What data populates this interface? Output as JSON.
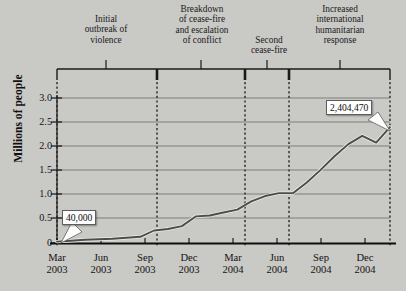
{
  "chart_data": {
    "type": "line",
    "title": "",
    "xlabel": "",
    "ylabel": "Millions of people",
    "ylim": [
      0,
      3.25
    ],
    "yticks": [
      "0",
      "0.5",
      "1.0",
      "1.5",
      "2.0",
      "2.5",
      "3.0"
    ],
    "ytick_values": [
      0,
      0.5,
      1.0,
      1.5,
      2.0,
      2.5,
      3.0
    ],
    "grid": "horizontal solid gridlines plus dotted vertical event lines",
    "legend": "none",
    "categories": [
      "Mar\n2003",
      "Jun\n2003",
      "Sep\n2003",
      "Dec\n2003",
      "Mar\n2004",
      "Jun\n2004",
      "Sep\n2004",
      "Dec\n2004"
    ],
    "x_tick_labels": [
      "Mar 2003",
      "Jun 2003",
      "Sep 2003",
      "Dec 2003",
      "Mar 2004",
      "Jun 2004",
      "Sep 2004",
      "Dec 2004"
    ],
    "series": [
      {
        "name": "Displaced people",
        "units": "millions",
        "points": [
          {
            "t": "2003-03",
            "v": 0.04
          },
          {
            "t": "2003-04",
            "v": 0.06
          },
          {
            "t": "2003-05",
            "v": 0.08
          },
          {
            "t": "2003-06",
            "v": 0.09
          },
          {
            "t": "2003-07",
            "v": 0.1
          },
          {
            "t": "2003-08",
            "v": 0.12
          },
          {
            "t": "2003-09",
            "v": 0.14
          },
          {
            "t": "2003-10",
            "v": 0.27
          },
          {
            "t": "2003-11",
            "v": 0.3
          },
          {
            "t": "2003-12",
            "v": 0.36
          },
          {
            "t": "2004-01",
            "v": 0.56
          },
          {
            "t": "2004-02",
            "v": 0.58
          },
          {
            "t": "2004-03",
            "v": 0.64
          },
          {
            "t": "2004-04",
            "v": 0.7
          },
          {
            "t": "2004-05",
            "v": 0.87
          },
          {
            "t": "2004-06",
            "v": 0.98
          },
          {
            "t": "2004-07",
            "v": 1.04
          },
          {
            "t": "2004-08",
            "v": 1.04
          },
          {
            "t": "2004-09",
            "v": 1.26
          },
          {
            "t": "2004-10",
            "v": 1.52
          },
          {
            "t": "2004-11",
            "v": 1.8
          },
          {
            "t": "2004-12",
            "v": 2.05
          },
          {
            "t": "2005-01",
            "v": 2.22
          },
          {
            "t": "2005-02",
            "v": 2.08
          },
          {
            "t": "2005-03",
            "v": 2.4
          }
        ]
      }
    ],
    "annotations": [
      {
        "name": "start-value",
        "text": "40,000",
        "points_to": "Mar 2003 start of series"
      },
      {
        "name": "end-value",
        "text": "2,404,470",
        "points_to": "end of series (~2.4 million)"
      }
    ],
    "events": [
      {
        "label": "Initial\noutbreak of\nviolence"
      },
      {
        "label": "Breakdown\nof cease-fire\nand escalation\nof conflict"
      },
      {
        "label": "Second\ncease-fire"
      },
      {
        "label": "Increased\ninternational\nhumanitarian\nresponse"
      }
    ]
  },
  "colors": {
    "background": "#c9c9c6",
    "line": "#4e4e4e",
    "line_highlight": "#b9b9b6",
    "axis": "#111111",
    "gridline": "#7a7a78",
    "callout_bg": "#fdfdfd"
  }
}
